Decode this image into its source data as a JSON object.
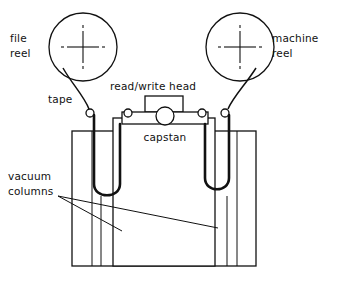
{
  "diagram": {
    "type": "line-drawing",
    "background_color": "#ffffff",
    "stroke_color": "#111111",
    "labels": {
      "file_reel_line1": "file",
      "file_reel_line2": "reel",
      "machine_reel_line1": "machine",
      "machine_reel_line2": "reel",
      "tape": "tape",
      "read_write_head": "read/write  head",
      "capstan": "capstan",
      "vacuum_columns_line1": "vacuum",
      "vacuum_columns_line2": "columns"
    },
    "components": {
      "file_reel": {
        "name": "file reel",
        "center_x": 83,
        "center_y": 47,
        "radius": 34
      },
      "machine_reel": {
        "name": "machine reel",
        "center_x": 240,
        "center_y": 47,
        "radius": 34
      },
      "left_guide_roller": {
        "name": "left guide roller",
        "center_x": 90,
        "center_y": 113,
        "radius": 4
      },
      "right_guide_roller": {
        "name": "right guide roller",
        "center_x": 225,
        "center_y": 113,
        "radius": 4
      },
      "capstan_roller": {
        "name": "capstan",
        "center_x": 165,
        "center_y": 116,
        "radius": 9
      },
      "head_left_roller": {
        "center_x": 128,
        "center_y": 113,
        "radius": 4
      },
      "head_right_roller": {
        "center_x": 202,
        "center_y": 113,
        "radius": 4
      }
    }
  }
}
